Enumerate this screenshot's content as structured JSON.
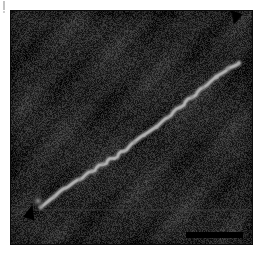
{
  "figure": {
    "type": "electron-micrograph",
    "panel_label": "",
    "background_color": "#ffffff",
    "field_color": "#1d1d1d",
    "width": 266,
    "height": 256
  },
  "micrograph": {
    "name": "micrograph-field",
    "description": "Dark grainy electron micrograph field containing a single extended light-gray filament running diagonally from lower-left to upper-right.",
    "field_mean_gray": "#262626",
    "noise_amplitude": 26,
    "filament": {
      "name": "filament",
      "color": "#9a9a9a",
      "core_color": "#b5b5b5",
      "width_px": 3.2,
      "start": [
        30,
        196
      ],
      "end": [
        228,
        52
      ],
      "path_points": [
        [
          30,
          196
        ],
        [
          36,
          192
        ],
        [
          43,
          186
        ],
        [
          49,
          180
        ],
        [
          55,
          177
        ],
        [
          62,
          172
        ],
        [
          69,
          168
        ],
        [
          75,
          164
        ],
        [
          81,
          160
        ],
        [
          86,
          157
        ],
        [
          92,
          153
        ],
        [
          97,
          150
        ],
        [
          103,
          147
        ],
        [
          108,
          143
        ],
        [
          113,
          140
        ],
        [
          118,
          136
        ],
        [
          123,
          131
        ],
        [
          128,
          127
        ],
        [
          133,
          124
        ],
        [
          139,
          120
        ],
        [
          145,
          116
        ],
        [
          151,
          111
        ],
        [
          157,
          106
        ],
        [
          163,
          101
        ],
        [
          169,
          96
        ],
        [
          175,
          91
        ],
        [
          181,
          86
        ],
        [
          187,
          81
        ],
        [
          193,
          76
        ],
        [
          199,
          71
        ],
        [
          205,
          66
        ],
        [
          211,
          62
        ],
        [
          217,
          58
        ],
        [
          223,
          55
        ],
        [
          228,
          52
        ]
      ]
    },
    "bright_speck": {
      "name": "bright-speck",
      "position": [
        27,
        190
      ],
      "radius": 4,
      "color": "#8e8e8e"
    },
    "horizontal_seam": {
      "name": "scan-seam",
      "y": 198,
      "color": "#3a3a3a"
    }
  },
  "annotations": {
    "arrow_top_right": {
      "name": "arrowhead-top-right",
      "label": "",
      "color": "#000000",
      "points_to": "upper filament end",
      "position": [
        218,
        12
      ]
    },
    "arrow_bottom_left": {
      "name": "arrowhead-bottom-left",
      "label": "",
      "color": "#000000",
      "points_to": "lower filament end",
      "position": [
        14,
        205
      ]
    },
    "scale_bar": {
      "name": "scale-bar",
      "label": "",
      "color": "#000000",
      "length_px": 57,
      "position": [
        186,
        232
      ]
    }
  }
}
